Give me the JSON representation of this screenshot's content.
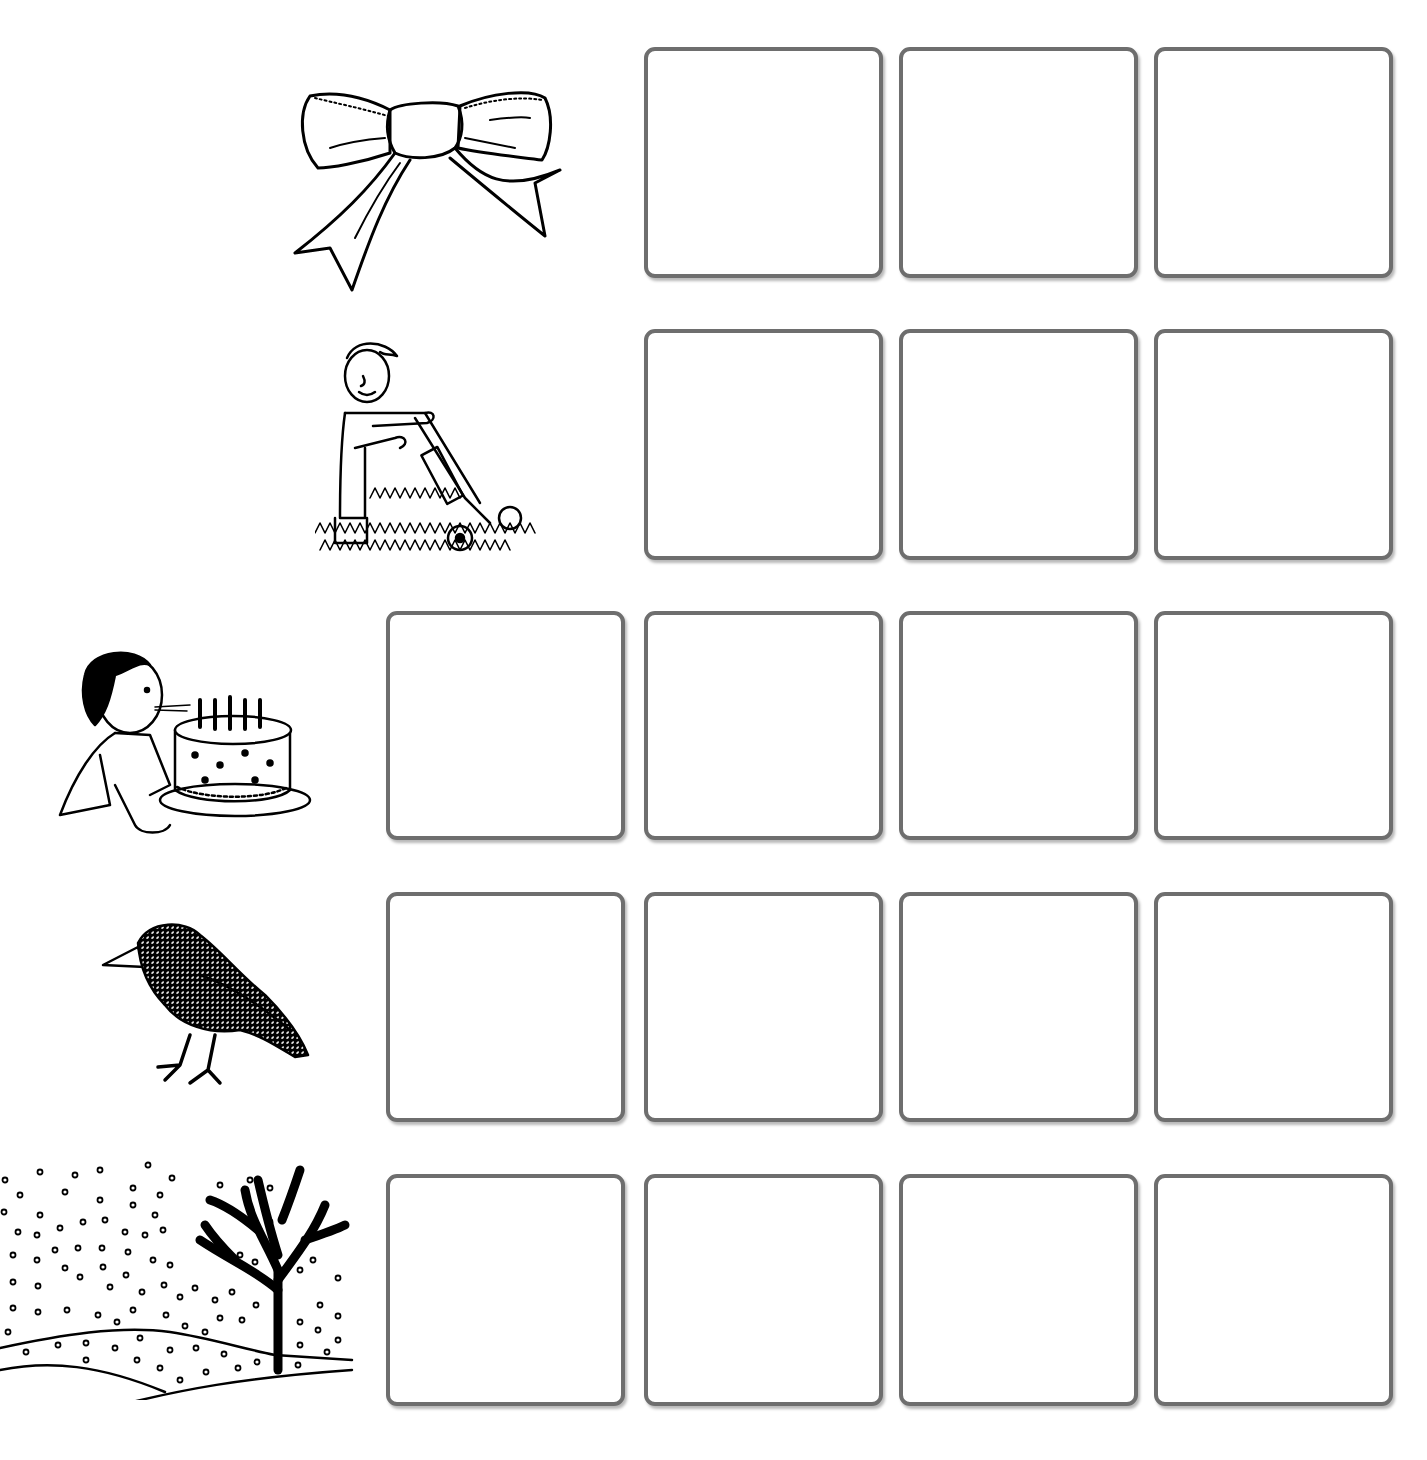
{
  "worksheet": {
    "type": "sound-box activity",
    "rows": [
      {
        "picture": "bow",
        "picture_icon": "bow-icon",
        "box_count": 3
      },
      {
        "picture": "mow",
        "picture_icon": "man-mowing-lawn-icon",
        "box_count": 3
      },
      {
        "picture": "blow",
        "picture_icon": "girl-blowing-candles-icon",
        "box_count": 4
      },
      {
        "picture": "crow",
        "picture_icon": "crow-icon",
        "box_count": 4
      },
      {
        "picture": "snow",
        "picture_icon": "snowy-tree-icon",
        "box_count": 4
      }
    ],
    "colors": {
      "box_border": "#6e6e6e",
      "line_art": "#000000",
      "background": "#ffffff"
    }
  }
}
